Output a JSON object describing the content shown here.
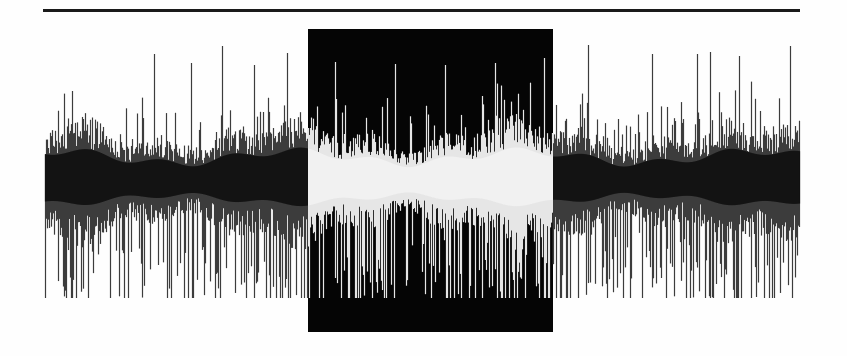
{
  "editor": {
    "title": "",
    "width": 847,
    "height": 356,
    "background": "#fefefe"
  },
  "top_rule": {
    "x1": 43,
    "x2": 800,
    "y": 9,
    "thickness": 3,
    "color": "#1a1a1a"
  },
  "waveform": {
    "x_start": 45,
    "x_end": 799,
    "center_y": 182,
    "line_color": "#2a2a2a",
    "spike_color": "#3c3c3c",
    "dense_color": "#111111",
    "base_half_amplitude": 45,
    "upper_peak_min_y": 44,
    "lower_peak_max_y": 298,
    "spike_count": 150,
    "seed": 7
  },
  "selection": {
    "x": 308,
    "y": 29,
    "width": 245,
    "height": 303,
    "background": "#050505",
    "inverted_wave_color": "#e6e6e6",
    "selected": true
  },
  "peaks": [
    {
      "x": 154,
      "top": 54
    },
    {
      "x": 191,
      "top": 63
    },
    {
      "x": 222,
      "top": 46
    },
    {
      "x": 254,
      "top": 65
    },
    {
      "x": 287,
      "top": 53
    },
    {
      "x": 335,
      "top": 62
    },
    {
      "x": 395,
      "top": 64
    },
    {
      "x": 445,
      "top": 65
    },
    {
      "x": 495,
      "top": 63
    },
    {
      "x": 544,
      "top": 58
    },
    {
      "x": 588,
      "top": 45
    },
    {
      "x": 652,
      "top": 54
    },
    {
      "x": 697,
      "top": 54
    },
    {
      "x": 710,
      "top": 52
    },
    {
      "x": 739,
      "top": 56
    },
    {
      "x": 790,
      "top": 46
    }
  ]
}
